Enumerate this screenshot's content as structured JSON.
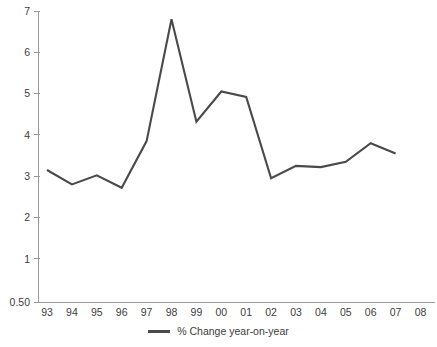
{
  "chart_data": {
    "type": "line",
    "title": "",
    "xlabel": "",
    "ylabel": "",
    "categories": [
      "93",
      "94",
      "95",
      "96",
      "97",
      "98",
      "99",
      "00",
      "01",
      "02",
      "03",
      "04",
      "05",
      "06",
      "07",
      "08"
    ],
    "series": [
      {
        "name": "% Change year-on-year",
        "color": "#4a4a4a",
        "values": [
          3.15,
          2.8,
          3.02,
          2.72,
          3.85,
          6.8,
          4.32,
          5.05,
          4.92,
          2.95,
          3.25,
          3.22,
          3.35,
          3.8,
          3.55,
          null
        ]
      }
    ],
    "x_tick_labels": [
      "93",
      "94",
      "95",
      "96",
      "97",
      "98",
      "99",
      "00",
      "01",
      "02",
      "03",
      "04",
      "05",
      "06",
      "07",
      "08"
    ],
    "y_tick_labels": [
      "7",
      "6",
      "5",
      "4",
      "3",
      "2",
      "1",
      "0.50"
    ],
    "y_tick_values": [
      7,
      6,
      5,
      4,
      3,
      2,
      1,
      0.5
    ],
    "ylim": [
      0.5,
      7
    ],
    "grid": false,
    "legend_position": "bottom-center",
    "legend": [
      "% Change year-on-year"
    ],
    "axis_color": "#9a9a9a",
    "text_color": "#3c3c3c"
  },
  "legend": {
    "entry_label": "% Change year-on-year",
    "swatch_color": "#4a4a4a"
  }
}
